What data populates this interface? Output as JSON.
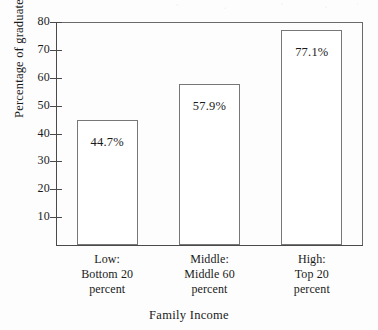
{
  "chart_data": {
    "type": "bar",
    "title": "",
    "subtitle": "",
    "xlabel": "Family Income",
    "ylabel": "Percentage of graduates",
    "categories": [
      "Low:\nBottom 20\npercent",
      "Middle:\nMiddle 60\npercent",
      "High:\nTop 20\npercent"
    ],
    "category_lines": [
      [
        "Low:",
        "Bottom 20",
        "percent"
      ],
      [
        "Middle:",
        "Middle 60",
        "percent"
      ],
      [
        "High:",
        "Top 20",
        "percent"
      ]
    ],
    "values": [
      44.7,
      57.9,
      77.1
    ],
    "value_labels": [
      "44.7%",
      "57.9%",
      "77.1%"
    ],
    "ylim": [
      0,
      80
    ],
    "yticks": [
      10,
      20,
      30,
      40,
      50,
      60,
      70,
      80
    ],
    "ytick_labels": [
      "10",
      "20",
      "30",
      "40",
      "50",
      "60",
      "70",
      "80"
    ],
    "grid": false,
    "legend": null,
    "bar_fill_color": "#ffffff",
    "bar_edge_color": "#777777",
    "axis_color": "#4a4a4a",
    "text_color": "#1a1a1a",
    "background_color": "#fdfdfd"
  },
  "axes": {
    "y_title": "Percentage of graduates",
    "x_title": "Family Income"
  },
  "bars": [
    {
      "label": "Low",
      "value_label": "44.7%",
      "value": 44.7
    },
    {
      "label": "Middle",
      "value_label": "57.9%",
      "value": 57.9
    },
    {
      "label": "High",
      "value_label": "77.1%",
      "value": 77.1
    }
  ]
}
